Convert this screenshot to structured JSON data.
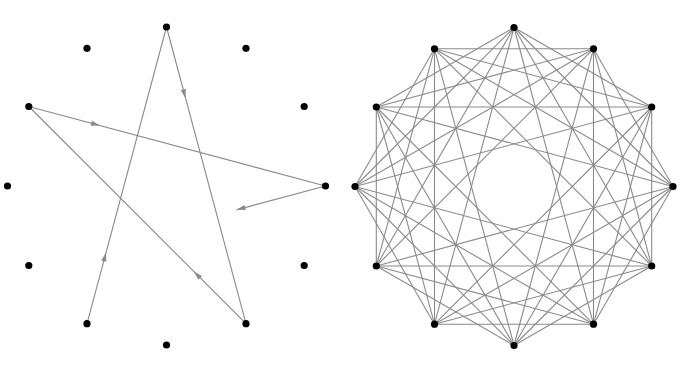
{
  "diagrams": [
    {
      "id": "left",
      "description": "12 points on a circle with a pentagram-like path stepping +5 around the points, drawn with arrows; last segment partial",
      "point_count": 12,
      "path_order": [
        7,
        0,
        5,
        10,
        3,
        8
      ],
      "path_step": 5,
      "last_segment_fraction": 0.3,
      "arrowheads": "mid-segment on full segments, tip at end of partial segment",
      "colors": {
        "vertex": "#000000",
        "edge": "#8a8a8a"
      }
    },
    {
      "id": "right",
      "description": "12 points on a circle, each joined to the vertices 2, 3, 4 and 5 steps away (no adjacent or diametric chords)",
      "point_count": 12,
      "chord_steps": [
        2,
        3,
        4,
        5
      ],
      "colors": {
        "vertex": "#000000",
        "edge": "#8a8a8a"
      }
    }
  ]
}
